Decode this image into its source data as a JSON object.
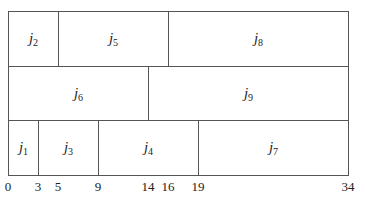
{
  "diagram": {
    "type": "gantt-schedule",
    "scale": {
      "origin_px": 8,
      "px_per_unit": 10
    },
    "rows": [
      {
        "name": "row-1",
        "top": 11,
        "height": 55,
        "jobs": [
          {
            "id": "j2",
            "letter": "j",
            "index": "2",
            "start": 0,
            "end": 5
          },
          {
            "id": "j5",
            "letter": "j",
            "index": "5",
            "start": 5,
            "end": 16
          },
          {
            "id": "j8",
            "letter": "j",
            "index": "8",
            "start": 16,
            "end": 34
          }
        ]
      },
      {
        "name": "row-2",
        "top": 66,
        "height": 55,
        "jobs": [
          {
            "id": "j6",
            "letter": "j",
            "index": "6",
            "start": 0,
            "end": 14
          },
          {
            "id": "j9",
            "letter": "j",
            "index": "9",
            "start": 14,
            "end": 34
          }
        ]
      },
      {
        "name": "row-3",
        "top": 120,
        "height": 55,
        "jobs": [
          {
            "id": "j1",
            "letter": "j",
            "index": "1",
            "start": 0,
            "end": 3
          },
          {
            "id": "j3",
            "letter": "j",
            "index": "3",
            "start": 3,
            "end": 9
          },
          {
            "id": "j4",
            "letter": "j",
            "index": "4",
            "start": 9,
            "end": 19
          },
          {
            "id": "j7",
            "letter": "j",
            "index": "7",
            "start": 19,
            "end": 34
          }
        ]
      }
    ],
    "axis_ticks": [
      "0",
      "3",
      "5",
      "9",
      "14",
      "16",
      "19",
      "34"
    ]
  }
}
